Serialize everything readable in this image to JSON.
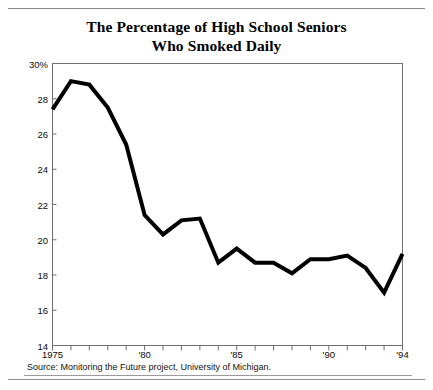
{
  "figure": {
    "title_line1": "The Percentage of High School Seniors",
    "title_line2": "Who Smoked Daily",
    "source": "Source: Monitoring the Future project, University of Michigan."
  },
  "chart_data": {
    "type": "line",
    "title": "The Percentage of High School Seniors Who Smoked Daily",
    "subtitle": "",
    "xlabel": "",
    "ylabel": "",
    "source": "Source: Monitoring the Future project, University of Michigan.",
    "x": [
      1975,
      1976,
      1977,
      1978,
      1979,
      1980,
      1981,
      1982,
      1983,
      1984,
      1985,
      1986,
      1987,
      1988,
      1989,
      1990,
      1991,
      1992,
      1993,
      1994
    ],
    "values": [
      27.4,
      29.0,
      28.8,
      27.5,
      25.4,
      21.4,
      20.3,
      21.1,
      21.2,
      18.7,
      19.5,
      18.7,
      18.7,
      18.1,
      18.9,
      18.9,
      19.1,
      18.4,
      17.0,
      19.2
    ],
    "series": [
      {
        "name": "Percent smoked daily",
        "values": [
          27.4,
          29.0,
          28.8,
          27.5,
          25.4,
          21.4,
          20.3,
          21.1,
          21.2,
          18.7,
          19.5,
          18.7,
          18.7,
          18.1,
          18.9,
          18.9,
          19.1,
          18.4,
          17.0,
          19.2
        ]
      }
    ],
    "xlim": [
      1975,
      1994
    ],
    "ylim": [
      14,
      30
    ],
    "ytick_values": [
      14,
      16,
      18,
      20,
      22,
      24,
      26,
      28,
      30
    ],
    "ytick_labels": [
      "14",
      "16",
      "18",
      "20",
      "22",
      "24",
      "26",
      "28",
      "30%"
    ],
    "xtick_values": [
      1975,
      1976,
      1977,
      1978,
      1979,
      1980,
      1981,
      1982,
      1983,
      1984,
      1985,
      1986,
      1987,
      1988,
      1989,
      1990,
      1991,
      1992,
      1993,
      1994
    ],
    "xtick_labels_shown": [
      {
        "value": 1975,
        "label": "1975"
      },
      {
        "value": 1980,
        "label": "'80"
      },
      {
        "value": 1985,
        "label": "'85"
      },
      {
        "value": 1990,
        "label": "'90"
      },
      {
        "value": 1994,
        "label": "'94"
      }
    ],
    "grid": false,
    "legend": "none",
    "line_color": "#000000",
    "line_width": 4,
    "frame_color": "#6f6f6f",
    "background": "#ffffff"
  }
}
